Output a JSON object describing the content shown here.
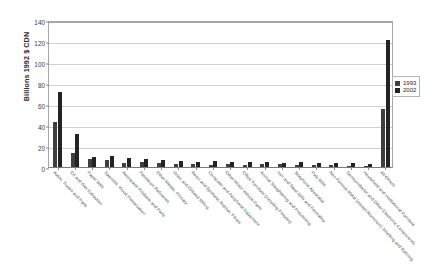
{
  "chart_data": {
    "type": "bar",
    "title": "",
    "subtitle": "",
    "xlabel": "",
    "ylabel": "Billions 1992 $ CDN",
    "ylim": [
      0,
      140
    ],
    "yticks": [
      0,
      20,
      40,
      60,
      80,
      100,
      120,
      140
    ],
    "grid": true,
    "legend_position": "right",
    "orientation": "vertical",
    "categories": [
      "Autos, Trucks and Parts",
      "Oil and Gas Extraction",
      "Paper Mills",
      "Sawmills, Wood Preservation",
      "Aerospace Products and Parts",
      "Petroleum Refineries",
      "Other Metals, Primary",
      "Grain and Oilseed Milling",
      "Resin and Synthetic Rubber, Fibres",
      "Computer and Peripheral Equipment",
      "Other Motor Vehicle Parts",
      "Office Furniture (including Fixtures)",
      "Animal Slaughtering and Processing",
      "Iron and Steel Mills and Ferroalloy",
      "Telephone Apparatus",
      "Pulp Mills",
      "Non-Ferrous Metal (except Aluminum) Smelting and Refining",
      "Semiconductor and Other Electronic Components",
      "Household and Institutional Furniture",
      "All Others"
    ],
    "series": [
      {
        "name": "1993",
        "color": "#3f3f3f",
        "values": [
          43,
          13,
          7.5,
          6.5,
          3.5,
          4.5,
          4.0,
          3.2,
          3.0,
          2.2,
          2.8,
          2.0,
          2.5,
          2.6,
          1.6,
          2.2,
          2.0,
          1.2,
          1.4,
          55
        ]
      },
      {
        "name": "2002",
        "color": "#232323",
        "values": [
          71,
          31,
          9.5,
          10.5,
          9.0,
          7.5,
          6.5,
          5.5,
          5.2,
          6.0,
          4.8,
          5.0,
          4.4,
          4.2,
          4.6,
          3.6,
          3.4,
          3.8,
          3.2,
          121
        ]
      }
    ]
  },
  "legend": {
    "entries": [
      {
        "label": "1993"
      },
      {
        "label": "2002"
      }
    ]
  }
}
